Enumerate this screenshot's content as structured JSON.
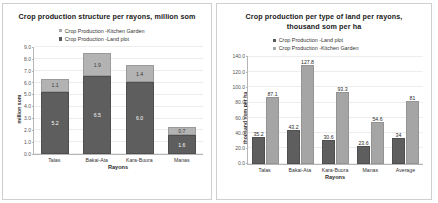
{
  "chart_data": [
    {
      "id": "left",
      "type": "bar",
      "subtype": "stacked",
      "title": "Crop production structure per rayons, million som",
      "xlabel": "Rayons",
      "ylabel": "million som",
      "categories": [
        "Talas",
        "Bakai-Ata",
        "Kara-Buura",
        "Manas"
      ],
      "ylim": [
        0.0,
        9.0
      ],
      "yticks": [
        "9.0",
        "8.0",
        "7.0",
        "6.0",
        "5.0",
        "4.0",
        "3.0",
        "2.0",
        "1.0",
        "0.0"
      ],
      "ytick_values": [
        9.0,
        8.0,
        7.0,
        6.0,
        5.0,
        4.0,
        3.0,
        2.0,
        1.0,
        0.0
      ],
      "grid": true,
      "legend_position": "top-center",
      "series": [
        {
          "name": "Crop Production -Kitchen Garden",
          "color": "#b3b3b3",
          "values": [
            1.1,
            1.9,
            1.4,
            0.7
          ],
          "labels": [
            "1.1",
            "1.9",
            "1.4",
            "0.7"
          ]
        },
        {
          "name": "Crop Production -Land plot",
          "color": "#5e5e5e",
          "values": [
            5.2,
            6.5,
            6.0,
            1.6
          ],
          "labels": [
            "5.2",
            "6.5",
            "6.0",
            "1.6"
          ]
        }
      ]
    },
    {
      "id": "right",
      "type": "bar",
      "subtype": "grouped",
      "title": "Crop production per type of land per rayons, thousand som per ha",
      "xlabel": "Rayons",
      "ylabel": "thousand som per ha",
      "categories": [
        "Talas",
        "Bakai-Ata",
        "Kara-Buura",
        "Manas",
        "Average"
      ],
      "ylim": [
        0.0,
        140.0
      ],
      "yticks": [
        "140.0",
        "120.0",
        "100.0",
        "80.0",
        "60.0",
        "40.0",
        "20.0",
        "0.0"
      ],
      "ytick_values": [
        140.0,
        120.0,
        100.0,
        80.0,
        60.0,
        40.0,
        20.0,
        0.0
      ],
      "grid": true,
      "legend_position": "top-center",
      "series": [
        {
          "name": "Crop Production -Land plot",
          "color": "#5e5e5e",
          "values": [
            35.2,
            43.2,
            30.6,
            23.6,
            34
          ],
          "labels": [
            "35.2",
            "43.2",
            "30.6",
            "23.6",
            "34"
          ]
        },
        {
          "name": "Crop Production -Kitchen Garden",
          "color": "#a5a5a5",
          "values": [
            87.1,
            127.8,
            93.3,
            54.6,
            81
          ],
          "labels": [
            "87.1",
            "127.8",
            "93.3",
            "54.6",
            "81"
          ]
        }
      ]
    }
  ]
}
